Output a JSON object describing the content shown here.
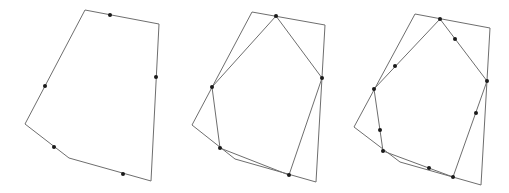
{
  "diagram": {
    "colors": {
      "edge": "#6e6e6e",
      "dot": "#1a1a1a",
      "background": "#ffffff"
    },
    "panels": [
      {
        "id": "panel-1",
        "polygons": [
          {
            "role": "original",
            "points": [
              [
                85,
                10
              ],
              [
                159,
                24
              ],
              [
                151,
                181
              ],
              [
                69,
                158
              ],
              [
                25,
                124
              ]
            ]
          }
        ],
        "dots": [
          [
            110,
            15
          ],
          [
            156,
            77
          ],
          [
            123,
            174
          ],
          [
            54,
            147
          ],
          [
            45,
            86
          ]
        ]
      },
      {
        "id": "panel-2",
        "polygons": [
          {
            "role": "original",
            "points": [
              [
                252,
                12
              ],
              [
                325,
                25
              ],
              [
                316,
                182
              ],
              [
                235,
                159
              ],
              [
                192,
                125
              ]
            ]
          },
          {
            "role": "midpoint",
            "points": [
              [
                276,
                16
              ],
              [
                322,
                78
              ],
              [
                289,
                175
              ],
              [
                220,
                148
              ],
              [
                212,
                87
              ]
            ]
          }
        ],
        "dots": [
          [
            276,
            16
          ],
          [
            322,
            78
          ],
          [
            289,
            175
          ],
          [
            220,
            148
          ],
          [
            212,
            87
          ]
        ]
      },
      {
        "id": "panel-3",
        "polygons": [
          {
            "role": "original",
            "points": [
              [
                415,
                14
              ],
              [
                490,
                28
              ],
              [
                481,
                185
              ],
              [
                400,
                162
              ],
              [
                354,
                127
              ]
            ]
          },
          {
            "role": "midpoint",
            "points": [
              [
                440,
                19
              ],
              [
                487,
                81
              ],
              [
                453,
                177
              ],
              [
                383,
                151
              ],
              [
                374,
                89
              ]
            ]
          }
        ],
        "dots": [
          [
            440,
            19
          ],
          [
            487,
            81
          ],
          [
            453,
            177
          ],
          [
            383,
            151
          ],
          [
            374,
            89
          ],
          [
            455,
            39
          ],
          [
            476,
            113
          ],
          [
            429,
            168
          ],
          [
            380,
            130
          ],
          [
            395,
            66
          ]
        ]
      }
    ]
  }
}
